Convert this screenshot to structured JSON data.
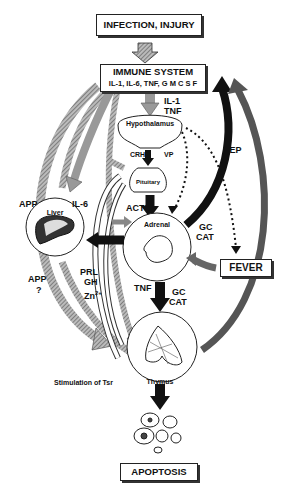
{
  "boxes": {
    "infection": "INFECTION, INJURY",
    "immune_title": "IMMUNE SYSTEM",
    "immune_sub": "IL-1, IL-6, TNF, G M C S F",
    "fever": "FEVER",
    "apoptosis": "APOPTOSIS"
  },
  "organs": {
    "hypothalamus": "Hypothalamus",
    "pituitary": "Pituitary",
    "liver": "Liver",
    "adrenal": "Adrenal",
    "thymus": "Thymus"
  },
  "labels": {
    "il1": "IL-1",
    "tnf_top": "TNF",
    "crh": "CRH",
    "vp": "VP",
    "lep": "LEP",
    "app_top": "APP",
    "il6": "IL-6",
    "acth": "ACTH",
    "gc1": "GC",
    "cat1": "CAT",
    "app_bottom": "APP",
    "question": "?",
    "prl": "PRL",
    "gh": "GH",
    "zn": "Zn",
    "zn_sup": "2+",
    "tnf_mid": "TNF",
    "gc2": "GC",
    "cat2": "CAT",
    "stimulation": "Stimulation of Tsr"
  }
}
